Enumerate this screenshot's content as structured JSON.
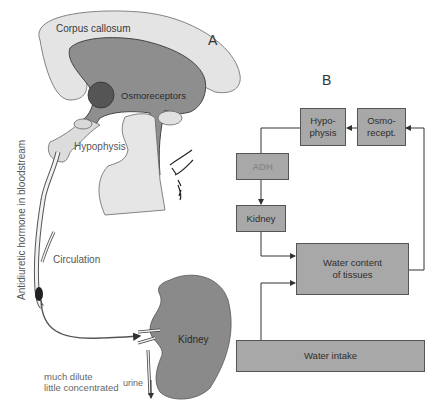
{
  "panels": {
    "a": {
      "letter": "A"
    },
    "b": {
      "letter": "B"
    }
  },
  "anatomy_labels": {
    "corpus_callosum": "Corpus callosum",
    "osmoreceptors": "Osmoreceptors",
    "hypophysis": "Hypophysis",
    "bloodstream": "Antidiuretic hormone in bloodstream",
    "circulation": "Circulation",
    "kidney": "Kidney",
    "much_dilute": "much dilute",
    "little_concentrated": "little concentrated",
    "urine": "urine"
  },
  "flowchart": {
    "boxes": {
      "hypophysis": {
        "line1": "Hypo-",
        "line2": "physis"
      },
      "osmorecept": {
        "line1": "Osmo-",
        "line2": "recept."
      },
      "adh": "ADH",
      "kidney": "Kidney",
      "water_content": {
        "line1": "Water content",
        "line2": "of tissues"
      },
      "water_intake": "Water intake"
    },
    "edges": [
      {
        "from": "Osmo-recept.",
        "to": "Hypo-physis"
      },
      {
        "from": "Hypo-physis",
        "to": "ADH"
      },
      {
        "from": "ADH",
        "to": "Kidney"
      },
      {
        "from": "Kidney",
        "to": "Water content of tissues"
      },
      {
        "from": "Water intake",
        "to": "Water content of tissues"
      },
      {
        "from": "Water content of tissues",
        "to": "Osmo-recept."
      }
    ]
  },
  "colors": {
    "box_fill": "#a8a8a8",
    "brain_light": "#e2e2e2",
    "brain_dark": "#8c8c8c",
    "osmoreceptor_dot": "#555555",
    "kidney_fill": "#8a8a8a"
  }
}
